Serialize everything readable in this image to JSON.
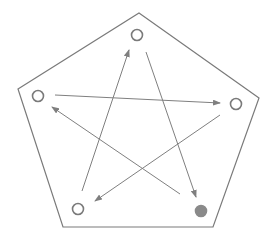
{
  "diagram": {
    "title": "",
    "colors": {
      "stroke": "#7a7a7a",
      "edge": "#7f7f7f",
      "node_fill_empty": "#ffffff",
      "node_fill_active": "#8a8a8a",
      "background": "#ffffff"
    },
    "boundary": {
      "shape": "pentagon",
      "points": [
        [
          139,
          13
        ],
        [
          259,
          98
        ],
        [
          213,
          227
        ],
        [
          63,
          227
        ],
        [
          18,
          89
        ]
      ]
    },
    "nodes": [
      {
        "id": "top",
        "cx": 137,
        "cy": 35,
        "r": 5.5,
        "filled": false
      },
      {
        "id": "right",
        "cx": 236,
        "cy": 104,
        "r": 5.5,
        "filled": false
      },
      {
        "id": "bottom-right",
        "cx": 201,
        "cy": 211,
        "r": 5.5,
        "filled": true
      },
      {
        "id": "bottom-left",
        "cx": 78,
        "cy": 209,
        "r": 5.5,
        "filled": false
      },
      {
        "id": "left",
        "cx": 38,
        "cy": 96,
        "r": 5.5,
        "filled": false
      }
    ],
    "edges": [
      {
        "from": "top",
        "to": "bottom-right",
        "x1": 146,
        "y1": 52,
        "x2": 196,
        "y2": 197
      },
      {
        "from": "bottom-left",
        "to": "top",
        "x1": 82,
        "y1": 191,
        "x2": 129,
        "y2": 50
      },
      {
        "from": "left",
        "to": "right",
        "x1": 55,
        "y1": 95,
        "x2": 220,
        "y2": 103
      },
      {
        "from": "right",
        "to": "bottom-left",
        "x1": 220,
        "y1": 115,
        "x2": 95,
        "y2": 201
      },
      {
        "from": "bottom-right",
        "to": "left",
        "x1": 180,
        "y1": 194,
        "x2": 52,
        "y2": 107
      }
    ]
  }
}
